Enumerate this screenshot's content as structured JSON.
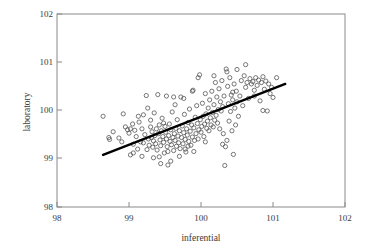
{
  "chart_data": {
    "type": "scatter",
    "title": "",
    "xlabel": "inferential",
    "ylabel": "laboratory",
    "xlim": [
      98,
      102
    ],
    "ylim": [
      98,
      102
    ],
    "xticks": [
      "98",
      "99",
      "100",
      "101",
      "102"
    ],
    "yticks": [
      "98",
      "99",
      "100",
      "101",
      "102"
    ],
    "grid": false,
    "legend": null,
    "marker": "open-circle",
    "trendline": {
      "type": "linear-fit",
      "x_start": 98.64,
      "y_start": 99.08,
      "x_end": 101.17,
      "y_end": 100.55,
      "slope": 0.581,
      "intercept": 41.77
    },
    "points": [
      [
        98.64,
        99.88
      ],
      [
        98.72,
        99.44
      ],
      [
        98.73,
        99.4
      ],
      [
        98.78,
        99.56
      ],
      [
        98.86,
        99.43
      ],
      [
        98.92,
        99.93
      ],
      [
        98.95,
        99.66
      ],
      [
        98.98,
        99.6
      ],
      [
        99.0,
        99.53
      ],
      [
        99.02,
        99.08
      ],
      [
        99.05,
        99.72
      ],
      [
        99.06,
        99.3
      ],
      [
        99.08,
        99.59
      ],
      [
        99.1,
        99.46
      ],
      [
        99.12,
        99.2
      ],
      [
        99.14,
        99.76
      ],
      [
        99.16,
        99.35
      ],
      [
        99.18,
        99.62
      ],
      [
        99.2,
        99.33
      ],
      [
        99.22,
        99.5
      ],
      [
        99.24,
        100.31
      ],
      [
        99.25,
        99.19
      ],
      [
        99.27,
        99.41
      ],
      [
        99.28,
        99.28
      ],
      [
        99.3,
        99.66
      ],
      [
        99.31,
        99.44
      ],
      [
        99.32,
        99.56
      ],
      [
        99.33,
        99.24
      ],
      [
        99.34,
        99.37
      ],
      [
        99.35,
        99.95
      ],
      [
        99.36,
        99.48
      ],
      [
        99.37,
        99.31
      ],
      [
        99.38,
        99.62
      ],
      [
        99.39,
        99.18
      ],
      [
        99.4,
        100.33
      ],
      [
        99.41,
        99.52
      ],
      [
        99.42,
        99.7
      ],
      [
        99.43,
        99.39
      ],
      [
        99.44,
        99.27
      ],
      [
        99.45,
        99.58
      ],
      [
        99.46,
        99.84
      ],
      [
        99.47,
        99.46
      ],
      [
        99.48,
        99.34
      ],
      [
        99.49,
        99.12
      ],
      [
        99.5,
        99.67
      ],
      [
        99.51,
        99.55
      ],
      [
        99.52,
        99.41
      ],
      [
        99.53,
        99.25
      ],
      [
        99.54,
        98.87
      ],
      [
        99.55,
        99.48
      ],
      [
        99.56,
        99.72
      ],
      [
        99.57,
        99.36
      ],
      [
        99.58,
        99.6
      ],
      [
        99.59,
        99.29
      ],
      [
        99.6,
        99.97
      ],
      [
        99.61,
        99.44
      ],
      [
        99.62,
        99.17
      ],
      [
        99.63,
        99.52
      ],
      [
        99.64,
        99.38
      ],
      [
        99.65,
        99.63
      ],
      [
        99.66,
        99.26
      ],
      [
        99.67,
        99.81
      ],
      [
        99.68,
        99.47
      ],
      [
        99.69,
        99.33
      ],
      [
        99.7,
        99.58
      ],
      [
        99.71,
        99.21
      ],
      [
        99.72,
        100.28
      ],
      [
        99.73,
        99.44
      ],
      [
        99.74,
        99.68
      ],
      [
        99.75,
        99.31
      ],
      [
        99.76,
        99.54
      ],
      [
        99.77,
        99.92
      ],
      [
        99.78,
        99.4
      ],
      [
        99.79,
        99.14
      ],
      [
        99.8,
        99.62
      ],
      [
        99.81,
        99.49
      ],
      [
        99.82,
        99.75
      ],
      [
        99.83,
        99.36
      ],
      [
        99.84,
        100.03
      ],
      [
        99.85,
        99.57
      ],
      [
        99.86,
        99.28
      ],
      [
        99.87,
        99.7
      ],
      [
        99.88,
        99.45
      ],
      [
        99.89,
        100.42
      ],
      [
        99.9,
        99.64
      ],
      [
        99.91,
        99.38
      ],
      [
        99.92,
        99.86
      ],
      [
        99.93,
        99.52
      ],
      [
        99.94,
        100.1
      ],
      [
        99.95,
        99.73
      ],
      [
        99.96,
        99.41
      ],
      [
        99.97,
        99.6
      ],
      [
        99.98,
        100.74
      ],
      [
        99.99,
        99.81
      ],
      [
        100.0,
        99.55
      ],
      [
        100.01,
        99.67
      ],
      [
        100.02,
        100.15
      ],
      [
        100.03,
        99.88
      ],
      [
        100.04,
        99.46
      ],
      [
        100.05,
        99.72
      ],
      [
        100.06,
        100.35
      ],
      [
        100.07,
        99.93
      ],
      [
        100.08,
        99.63
      ],
      [
        100.09,
        99.78
      ],
      [
        100.1,
        100.05
      ],
      [
        100.11,
        99.58
      ],
      [
        100.12,
        100.22
      ],
      [
        100.13,
        99.85
      ],
      [
        100.14,
        99.7
      ],
      [
        100.15,
        100.4
      ],
      [
        100.16,
        99.96
      ],
      [
        100.17,
        99.66
      ],
      [
        100.18,
        100.12
      ],
      [
        100.19,
        99.8
      ],
      [
        100.2,
        100.58
      ],
      [
        100.21,
        99.9
      ],
      [
        100.22,
        100.28
      ],
      [
        100.23,
        99.74
      ],
      [
        100.24,
        100.02
      ],
      [
        100.25,
        100.45
      ],
      [
        100.26,
        99.62
      ],
      [
        100.27,
        100.18
      ],
      [
        100.28,
        99.99
      ],
      [
        100.29,
        100.62
      ],
      [
        100.3,
        100.08
      ],
      [
        100.31,
        99.52
      ],
      [
        100.32,
        100.3
      ],
      [
        100.33,
        98.86
      ],
      [
        100.34,
        99.25
      ],
      [
        100.35,
        100.86
      ],
      [
        100.36,
        99.38
      ],
      [
        100.37,
        100.5
      ],
      [
        100.38,
        100.14
      ],
      [
        100.39,
        99.78
      ],
      [
        100.4,
        100.68
      ],
      [
        100.41,
        99.98
      ],
      [
        100.42,
        100.32
      ],
      [
        100.43,
        99.58
      ],
      [
        100.44,
        100.22
      ],
      [
        100.45,
        99.09
      ],
      [
        100.46,
        100.55
      ],
      [
        100.47,
        100.05
      ],
      [
        100.48,
        99.7
      ],
      [
        100.49,
        100.4
      ],
      [
        100.5,
        100.18
      ],
      [
        100.52,
        99.88
      ],
      [
        100.54,
        100.3
      ],
      [
        100.56,
        100.62
      ],
      [
        100.58,
        100.1
      ],
      [
        100.6,
        100.72
      ],
      [
        100.62,
        100.48
      ],
      [
        100.64,
        100.58
      ],
      [
        100.66,
        100.25
      ],
      [
        100.68,
        100.66
      ],
      [
        100.7,
        100.55
      ],
      [
        100.72,
        100.6
      ],
      [
        100.74,
        100.42
      ],
      [
        100.76,
        100.68
      ],
      [
        100.78,
        100.52
      ],
      [
        100.8,
        100.63
      ],
      [
        100.82,
        100.2
      ],
      [
        100.84,
        100.58
      ],
      [
        100.86,
        100.7
      ],
      [
        100.88,
        100.44
      ],
      [
        100.9,
        100.61
      ],
      [
        100.92,
        99.99
      ],
      [
        100.94,
        100.55
      ],
      [
        100.96,
        100.35
      ],
      [
        100.98,
        100.48
      ],
      [
        101.0,
        100.27
      ],
      [
        101.05,
        100.68
      ],
      [
        98.9,
        99.35
      ],
      [
        99.02,
        99.62
      ],
      [
        99.13,
        99.88
      ],
      [
        99.26,
        100.05
      ],
      [
        99.48,
        99.74
      ],
      [
        99.52,
        100.3
      ],
      [
        99.62,
        100.28
      ],
      [
        99.76,
        100.25
      ],
      [
        99.82,
        99.26
      ],
      [
        99.9,
        99.15
      ],
      [
        99.44,
        98.9
      ],
      [
        99.58,
        98.95
      ],
      [
        99.7,
        99.05
      ],
      [
        99.34,
        99.02
      ],
      [
        99.2,
        99.91
      ],
      [
        99.06,
        99.12
      ],
      [
        100.3,
        99.3
      ],
      [
        100.36,
        100.8
      ],
      [
        100.5,
        100.85
      ],
      [
        100.62,
        100.95
      ],
      [
        99.96,
        100.68
      ],
      [
        100.18,
        100.72
      ],
      [
        100.44,
        100.38
      ],
      [
        100.74,
        100.3
      ],
      [
        100.86,
        100.0
      ],
      [
        99.88,
        100.4
      ],
      [
        99.64,
        100.12
      ],
      [
        99.3,
        99.8
      ],
      [
        99.18,
        99.05
      ],
      [
        99.42,
        99.04
      ],
      [
        99.54,
        99.15
      ],
      [
        99.78,
        99.2
      ],
      [
        100.06,
        99.35
      ]
    ]
  },
  "figure": {
    "width": 370,
    "height": 251,
    "background": "#ffffff",
    "frame_color": "#8a8a8a",
    "point_color": "#4c4c4c",
    "line_color": "#000000"
  }
}
